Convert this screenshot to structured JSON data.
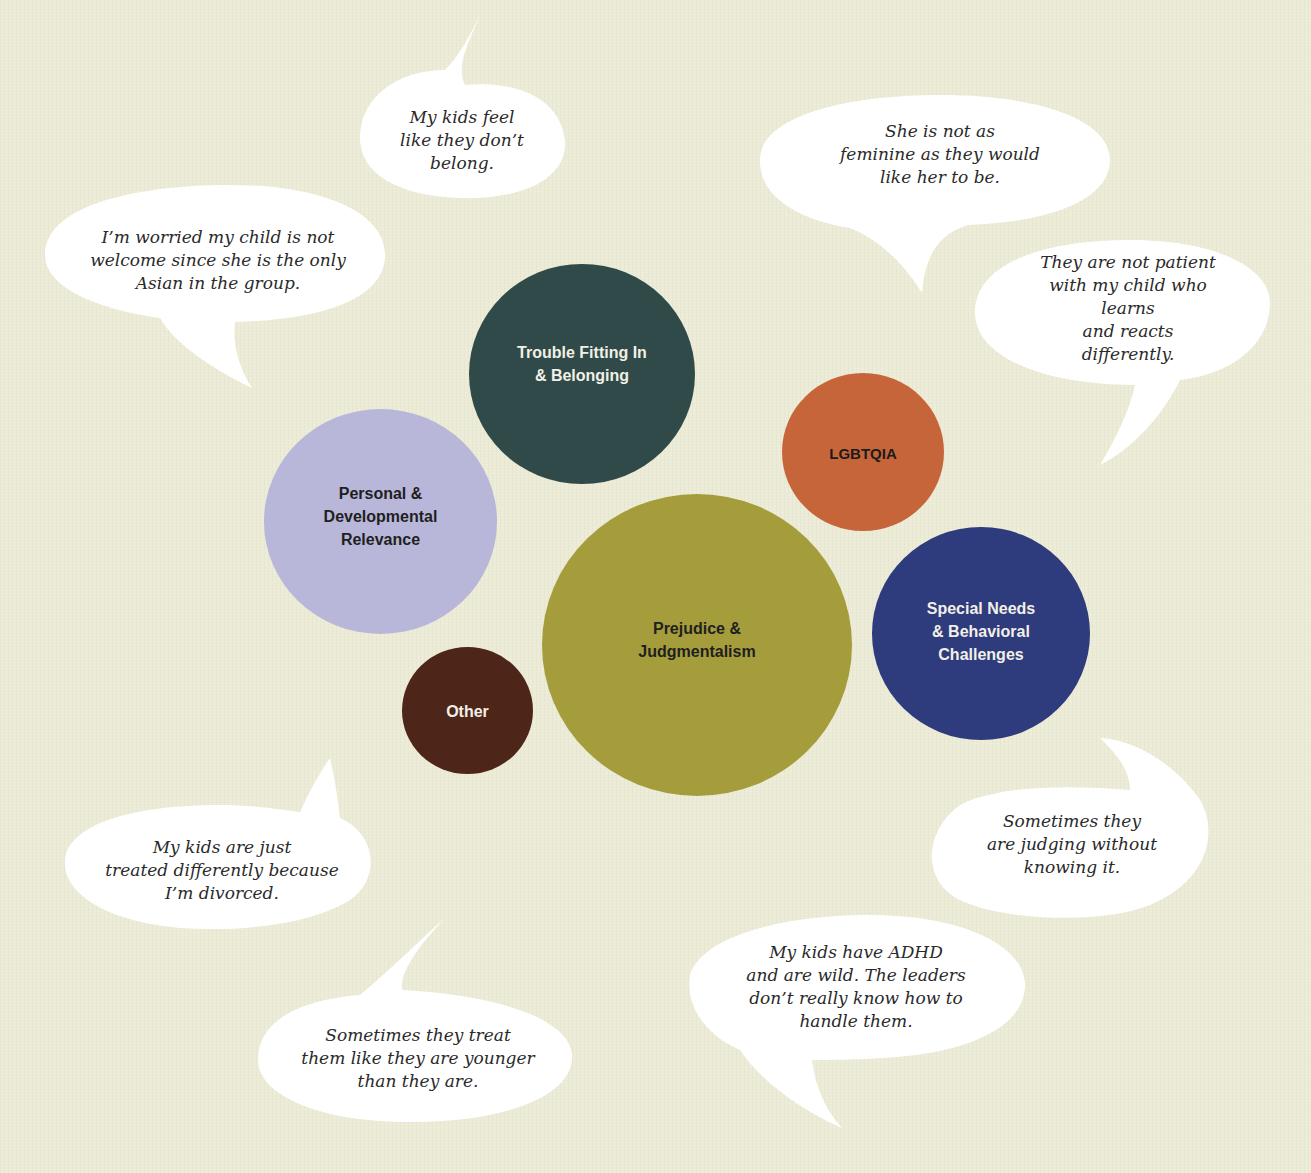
{
  "diagram": {
    "type": "bubble-cluster",
    "background_color": "#ecebd6",
    "categories": [
      {
        "id": "trouble-fitting-in",
        "label": "Trouble Fitting In\n& Belonging",
        "color": "#2f4a48",
        "text_color": "#f2f0e6"
      },
      {
        "id": "lgbtqia",
        "label": "LGBTQIA",
        "color": "#c7653a",
        "text_color": "#1b1b1b"
      },
      {
        "id": "personal-developmental",
        "label": "Personal &\nDevelopmental\nRelevance",
        "color": "#b8b7d9",
        "text_color": "#1f1f1f"
      },
      {
        "id": "prejudice-judgmentalism",
        "label": "Prejudice &\nJudgmentalism",
        "color": "#a59d3c",
        "text_color": "#1f1f1f"
      },
      {
        "id": "special-needs",
        "label": "Special Needs\n& Behavioral\nChallenges",
        "color": "#2e3b7d",
        "text_color": "#f2f0e6"
      },
      {
        "id": "other",
        "label": "Other",
        "color": "#4e2519",
        "text_color": "#f2f0e6"
      }
    ],
    "quotes": [
      {
        "id": "q1",
        "text": "My kids feel\nlike they don’t\nbelong."
      },
      {
        "id": "q2",
        "text": "She is not as\nfeminine as they would\nlike her to be."
      },
      {
        "id": "q3",
        "text": "I’m worried my child is not\nwelcome since she is the only\nAsian in the group."
      },
      {
        "id": "q4",
        "text": "They are not patient\nwith my child who learns\nand reacts differently."
      },
      {
        "id": "q5",
        "text": "My kids are just\ntreated differently because\nI’m divorced."
      },
      {
        "id": "q6",
        "text": "Sometimes they\nare judging without\nknowing it."
      },
      {
        "id": "q7",
        "text": "My kids have ADHD\nand are wild. The leaders\ndon’t really know how to\nhandle them."
      },
      {
        "id": "q8",
        "text": "Sometimes they treat\nthem like they are younger\nthan they are."
      }
    ]
  }
}
